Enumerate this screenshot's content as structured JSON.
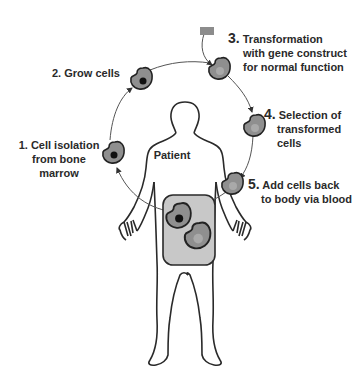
{
  "diagram": {
    "center_label": "Patient",
    "steps": [
      {
        "number": "1.",
        "lines": [
          "Cell isolation",
          "from bone",
          "marrow"
        ],
        "cell_nucleus": "dark"
      },
      {
        "number": "2.",
        "lines": [
          "Grow cells"
        ],
        "cell_nucleus": "dark"
      },
      {
        "number": "3.",
        "lines": [
          "Transformation",
          "with gene construct",
          "for normal function"
        ],
        "cell_nucleus": "light"
      },
      {
        "number": "4.",
        "lines": [
          "Selection of",
          "transformed",
          "cells"
        ],
        "cell_nucleus": "light"
      },
      {
        "number": "5.",
        "lines": [
          "Add cells back",
          "to body via blood"
        ],
        "cell_nucleus": "light"
      }
    ],
    "gene_construct": {
      "shape": "rectangle",
      "color": "#8c8c8c"
    },
    "colors": {
      "outline": "#2a2a2a",
      "cell_fill": "#8f8f8f",
      "nucleus_dark": "#111111",
      "nucleus_light": "#a9a9a9",
      "abdomen_fill": "#c8c8c8",
      "arrow": "#555555"
    }
  }
}
